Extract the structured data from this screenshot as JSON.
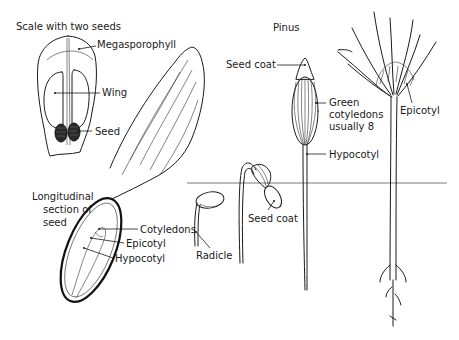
{
  "diagram": {
    "title": "Pinus",
    "ground_line": true,
    "figures": {
      "scale": {
        "heading": "Scale with two seeds",
        "labels": {
          "megasporophyll": "Megasporophyll",
          "wing": "Wing",
          "seed": "Seed"
        }
      },
      "winged_seed": {
        "section_label_lines": [
          "Longitudinal",
          "section of",
          "seed"
        ],
        "labels": {
          "cotyledons": "Cotyledons",
          "epicotyl": "Epicotyl",
          "hypocotyl": "Hypocotyl"
        }
      },
      "germinating_seed": {
        "labels": {
          "radicle": "Radicle"
        }
      },
      "hooked_seedling": {
        "labels": {
          "seed_coat": "Seed coat"
        }
      },
      "erect_seedling": {
        "labels": {
          "seed_coat": "Seed coat",
          "cotyledons_lines": [
            "Green",
            "cotyledons",
            "usually 8"
          ],
          "hypocotyl": "Hypocotyl"
        }
      },
      "mature_seedling": {
        "labels": {
          "epicotyl": "Epicotyl"
        }
      }
    }
  }
}
